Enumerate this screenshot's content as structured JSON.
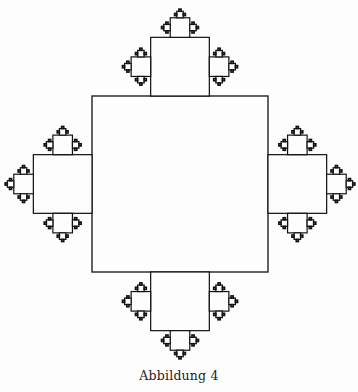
{
  "figure": {
    "caption": "Abbildung 4",
    "type": "square-fractal",
    "root_square": {
      "x": 92,
      "y": 96,
      "size": 176
    },
    "scale_ratio": 0.3333,
    "depth": 4,
    "stroke_color": "#111111",
    "background": "#fdfdfd"
  }
}
